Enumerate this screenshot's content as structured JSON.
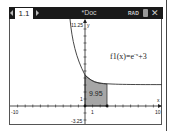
{
  "statusbar": {
    "tab_label": "1.1",
    "doc_title": "*Doc",
    "mode": "RAD",
    "close_symbol": "✕"
  },
  "graph": {
    "function_label": "f1(x)=e^-x+3",
    "function_name": "f1(x)=e",
    "function_exp": "-x",
    "function_tail": "+3",
    "integral_value": "9.95",
    "ymax_label": "11.25",
    "ymin_label": "-3.25",
    "xmin_label": "-10",
    "xmax_label": "10",
    "x_axis_name": "x",
    "y_axis_name": "y",
    "x_tick_label": "1",
    "y_tick_label": "1",
    "shade_color": "#a6a6a6",
    "curve_color": "#333333"
  }
}
